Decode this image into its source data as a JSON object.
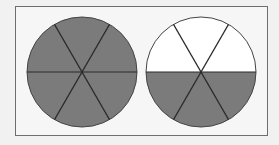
{
  "diagram": {
    "colors": {
      "background": "#f1f1f1",
      "frame_fill": "#f6f6f6",
      "frame_stroke": "#6e6e6e",
      "shaded": "#7b7b7b",
      "unshaded": "#ffffff",
      "line": "#2a2a2a"
    },
    "circles": [
      {
        "name": "left-circle",
        "total_parts": 6,
        "shaded_parts": 6,
        "fraction": "6/6"
      },
      {
        "name": "right-circle",
        "total_parts": 6,
        "shaded_parts": 3,
        "fraction": "3/6"
      }
    ]
  }
}
